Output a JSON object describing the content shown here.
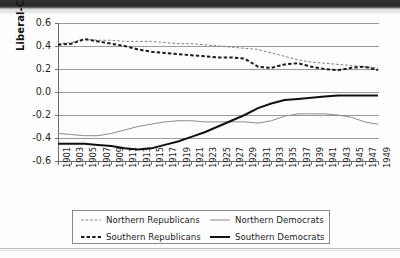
{
  "chart_data": {
    "type": "line",
    "title": "",
    "xlabel": "",
    "ylabel": "Liberal-Conservative",
    "xlim": [
      1901,
      1949
    ],
    "ylim": [
      -0.6,
      0.6
    ],
    "ytick_values": [
      0.6,
      0.4,
      0.2,
      0.0,
      -0.2,
      -0.4,
      -0.6
    ],
    "ytick_labels": [
      "0.6",
      "0.4",
      "0.2",
      "0.0",
      "-0.2",
      "-0.4",
      "-0.6"
    ],
    "grid": true,
    "grid_axis": "y",
    "legend_position": "below-axes",
    "x": [
      1901,
      1903,
      1905,
      1907,
      1909,
      1911,
      1913,
      1915,
      1917,
      1919,
      1921,
      1923,
      1925,
      1927,
      1929,
      1931,
      1933,
      1935,
      1937,
      1939,
      1941,
      1943,
      1945,
      1947,
      1949
    ],
    "xtick_labels": [
      "1901",
      "1903",
      "1905",
      "1907",
      "1909",
      "1911",
      "1913",
      "1915",
      "1917",
      "1919",
      "1921",
      "1923",
      "1925",
      "1927",
      "1929",
      "1931",
      "1933",
      "1935",
      "1937",
      "1939",
      "1941",
      "1943",
      "1945",
      "1947",
      "1949"
    ],
    "series": [
      {
        "name": "Northern Republicans",
        "style": "dashed",
        "width": "thin",
        "color": "#7d7d7d",
        "values": [
          0.42,
          0.43,
          0.46,
          0.45,
          0.45,
          0.44,
          0.44,
          0.44,
          0.43,
          0.42,
          0.42,
          0.41,
          0.4,
          0.39,
          0.38,
          0.37,
          0.34,
          0.31,
          0.28,
          0.26,
          0.25,
          0.24,
          0.23,
          0.22,
          0.21
        ]
      },
      {
        "name": "Southern Republicans",
        "style": "dashed",
        "width": "thick",
        "color": "#1b1b1b",
        "values": [
          0.41,
          0.42,
          0.46,
          0.44,
          0.42,
          0.4,
          0.37,
          0.35,
          0.34,
          0.33,
          0.32,
          0.31,
          0.3,
          0.3,
          0.29,
          0.22,
          0.21,
          0.24,
          0.25,
          0.22,
          0.2,
          0.19,
          0.21,
          0.22,
          0.19
        ]
      },
      {
        "name": "Northern Democrats",
        "style": "solid",
        "width": "thin",
        "color": "#8c8c8c",
        "values": [
          -0.36,
          -0.37,
          -0.38,
          -0.38,
          -0.36,
          -0.33,
          -0.3,
          -0.28,
          -0.26,
          -0.25,
          -0.25,
          -0.26,
          -0.26,
          -0.26,
          -0.26,
          -0.27,
          -0.25,
          -0.21,
          -0.19,
          -0.19,
          -0.19,
          -0.2,
          -0.22,
          -0.26,
          -0.28
        ]
      },
      {
        "name": "Southern Democrats",
        "style": "solid",
        "width": "thick",
        "color": "#111111",
        "values": [
          -0.45,
          -0.45,
          -0.45,
          -0.46,
          -0.47,
          -0.49,
          -0.5,
          -0.49,
          -0.46,
          -0.43,
          -0.39,
          -0.35,
          -0.3,
          -0.25,
          -0.2,
          -0.14,
          -0.1,
          -0.07,
          -0.06,
          -0.05,
          -0.04,
          -0.03,
          -0.03,
          -0.03,
          -0.03
        ]
      }
    ]
  },
  "legend": {
    "items": [
      {
        "label": "Northern Republicans"
      },
      {
        "label": "Northern Democrats"
      },
      {
        "label": "Southern Republicans"
      },
      {
        "label": "Southern Democrats"
      }
    ]
  }
}
